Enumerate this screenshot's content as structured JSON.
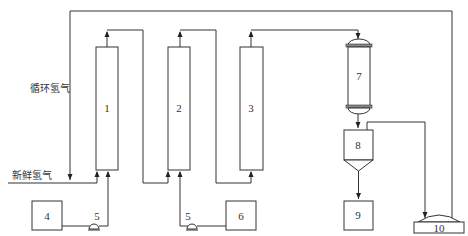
{
  "diagram": {
    "type": "process-flow",
    "labels": {
      "recycle_hydrogen": "循环氢气",
      "fresh_hydrogen": "新鲜氢气"
    },
    "units": [
      {
        "id": "1",
        "label": "1",
        "kind": "column"
      },
      {
        "id": "2",
        "label": "2",
        "kind": "column"
      },
      {
        "id": "3",
        "label": "3",
        "kind": "column"
      },
      {
        "id": "4",
        "label": "4",
        "kind": "tank"
      },
      {
        "id": "5a",
        "label": "5",
        "kind": "pump"
      },
      {
        "id": "5b",
        "label": "5",
        "kind": "pump"
      },
      {
        "id": "6",
        "label": "6",
        "kind": "tank"
      },
      {
        "id": "7",
        "label": "7",
        "kind": "vessel"
      },
      {
        "id": "8",
        "label": "8",
        "kind": "separator"
      },
      {
        "id": "9",
        "label": "9",
        "kind": "tank"
      },
      {
        "id": "10",
        "label": "10",
        "kind": "compressor"
      }
    ],
    "colors": {
      "line": "#333333",
      "background": "#ffffff"
    }
  }
}
